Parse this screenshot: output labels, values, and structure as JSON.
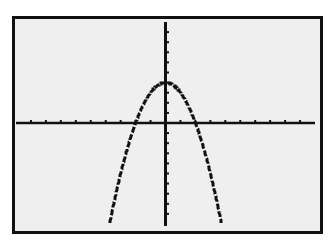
{
  "screen": {
    "background": "#efefef",
    "border_color": "#111111",
    "ink_color": "#111111"
  },
  "chart_data": {
    "type": "line",
    "title": "",
    "xlabel": "",
    "ylabel": "",
    "function": "y = 4 - x^2",
    "xlim": [
      -10,
      10
    ],
    "ylim": [
      -10,
      10
    ],
    "xscl": 1,
    "yscl": 1,
    "grid": false,
    "legend": null,
    "vertex": [
      0,
      4
    ],
    "x_intercepts": [
      -2,
      2
    ],
    "y_intercept": 4,
    "series": [
      {
        "name": "Y1",
        "x": [
          -3.74,
          -3.5,
          -3,
          -2.5,
          -2,
          -1.5,
          -1,
          -0.5,
          0,
          0.5,
          1,
          1.5,
          2,
          2.5,
          3,
          3.5,
          3.74
        ],
        "values": [
          -10,
          -8.25,
          -5,
          -2.25,
          0,
          1.75,
          3,
          3.75,
          4,
          3.75,
          3,
          1.75,
          0,
          -2.25,
          -5,
          -8.25,
          -10
        ]
      }
    ]
  }
}
